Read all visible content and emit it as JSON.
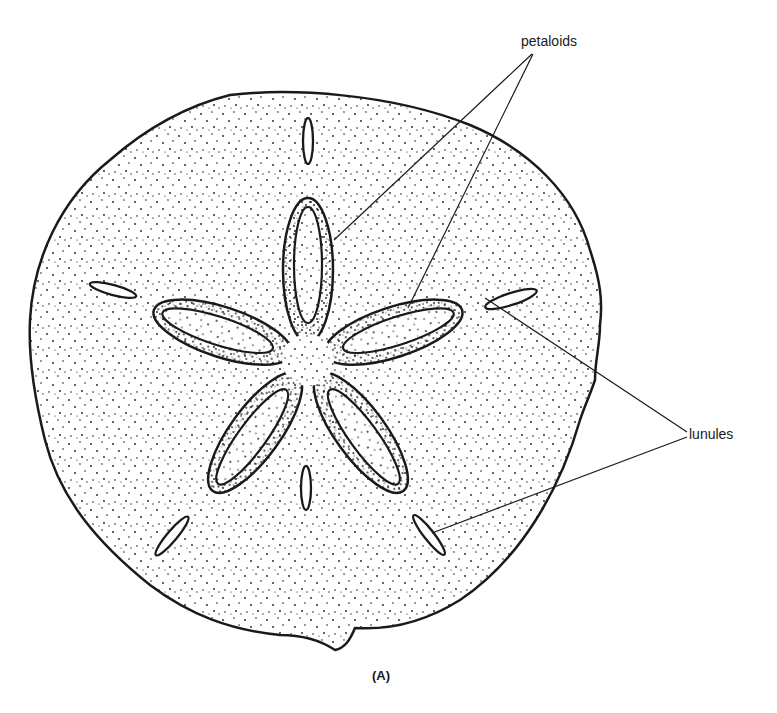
{
  "figure": {
    "caption": "(A)",
    "labels": {
      "petaloids": "petaloids",
      "lunules": "lunules"
    },
    "colors": {
      "ink": "#1a1a1a",
      "background": "#ffffff"
    },
    "petaloid_count": 5,
    "lunule_count": 5
  }
}
